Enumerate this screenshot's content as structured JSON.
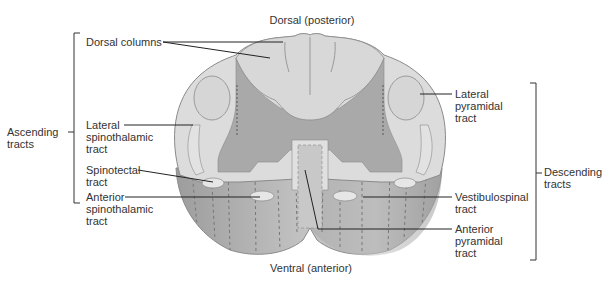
{
  "diagram": {
    "type": "anatomical-cross-section"
  },
  "orientation": {
    "top": "Dorsal (posterior)",
    "bottom": "Ventral (anterior)"
  },
  "groups": {
    "ascending": {
      "line1": "Ascending",
      "line2": "tracts"
    },
    "descending": {
      "line1": "Descending",
      "line2": "tracts"
    }
  },
  "labels": {
    "dorsal_columns": {
      "line1": "Dorsal columns"
    },
    "lateral_spinothalamic": {
      "line1": "Lateral",
      "line2": "spinothalamic",
      "line3": "tract"
    },
    "spinotectal": {
      "line1": "Spinotectal",
      "line2": "tract"
    },
    "anterior_spinothalamic": {
      "line1": "Anterior",
      "line2": "spinothalamic",
      "line3": "tract"
    },
    "lateral_pyramidal": {
      "line1": "Lateral",
      "line2": "pyramidal",
      "line3": "tract"
    },
    "vestibulospinal": {
      "line1": "Vestibulospinal",
      "line2": "tract"
    },
    "anterior_pyramidal": {
      "line1": "Anterior",
      "line2": "pyramidal",
      "line3": "tract"
    }
  },
  "colors": {
    "white_matter": "#dcdcdc",
    "gray_matter": "#a9a9a9",
    "column_side": "#b5b5b5",
    "tract_highlight": "#e6e6e6",
    "outline": "#8a8a8a",
    "leader": "#222222"
  }
}
